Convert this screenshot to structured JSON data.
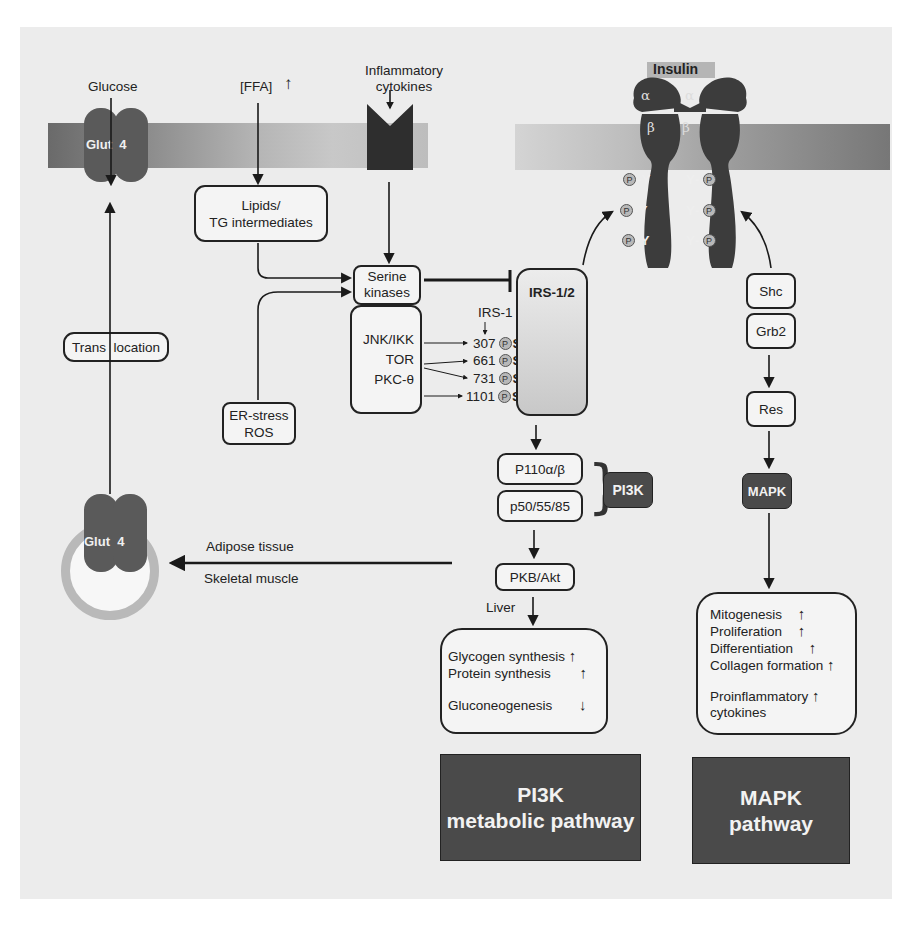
{
  "membrane": {
    "glut4_label": "Glut  4",
    "glucose_label": "Glucose",
    "ffa_label": "[FFA]",
    "ffa_trend": "↑",
    "cytokines_label_1": "Inflammatory",
    "cytokines_label_2": "cytokines"
  },
  "insulin_receptor": {
    "insulin_label": "Insulin",
    "alpha": "α",
    "beta": "β",
    "phospho_tyrosine": "Y",
    "phospho": "P"
  },
  "left_branch": {
    "lipids_line1": "Lipids/",
    "lipids_line2": "TG intermediates",
    "translocation": "Trans  location",
    "er_stress_line1": "ER-stress",
    "er_stress_line2": "ROS",
    "vesicle_glut4": "Glut  4",
    "adipose": "Adipose tissue",
    "skeletal": "Skeletal muscle"
  },
  "serine_kinases": {
    "label_line1": "Serine",
    "label_line2": "kinases",
    "members": [
      "JNK/IKK",
      "TOR",
      "PKC-θ"
    ],
    "irs1_label": "IRS-1",
    "sites": [
      {
        "position": "307",
        "residue": "S"
      },
      {
        "position": "661",
        "residue": "S"
      },
      {
        "position": "731",
        "residue": "S"
      },
      {
        "position": "1101",
        "residue": "S"
      }
    ]
  },
  "irs": {
    "label": "IRS-1/2"
  },
  "pi3k_branch": {
    "p110": "P110α/β",
    "p50": "p50/55/85",
    "pi3k_label": "PI3K",
    "pkb": "PKB/Akt",
    "liver": "Liver",
    "outcomes": [
      {
        "label": "Glycogen synthesis",
        "trend": "↑"
      },
      {
        "label": "Protein synthesis",
        "trend": "↑"
      },
      {
        "label": "Gluconeogenesis",
        "trend": "↓"
      }
    ],
    "pathway_line1": "PI3K",
    "pathway_line2": "metabolic pathway"
  },
  "mapk_branch": {
    "shc": "Shc",
    "grb2": "Grb2",
    "res": "Res",
    "mapk_label": "MAPK",
    "outcomes": [
      {
        "label": "Mitogenesis",
        "trend": "↑"
      },
      {
        "label": "Proliferation",
        "trend": "↑"
      },
      {
        "label": "Differentiation",
        "trend": "↑"
      },
      {
        "label": "Collagen formation",
        "trend": "↑"
      },
      {
        "label": "Proinflammatory",
        "trend": "↑"
      },
      {
        "label": "cytokines",
        "trend": ""
      }
    ],
    "pathway_line1": "MAPK",
    "pathway_line2": "pathway"
  },
  "colors": {
    "background_panel": "#ececec",
    "membrane_dark": "#6e6e6e",
    "membrane_light": "#cfcfcf",
    "protein_dark": "#4a4a4a",
    "irs_fill": "#c9c9c9",
    "vesicle_ring": "#b9b9b9"
  }
}
